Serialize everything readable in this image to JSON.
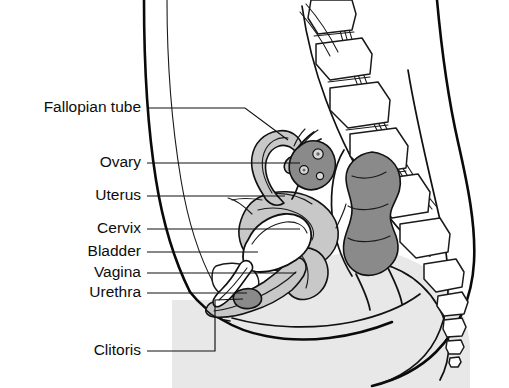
{
  "figure": {
    "width": 509,
    "height": 388,
    "background": "#ffffff"
  },
  "colors": {
    "background": "#ffffff",
    "outline": "#0a0a0a",
    "leader_line": "#111111",
    "label_text": "#0d0d0d",
    "body_fill": "#e8e8e8",
    "organ_light_gray": "#c8c8c8",
    "organ_mid_gray": "#b4b4b4",
    "organ_dark_gray": "#8a8a8a",
    "bone_fill": "#ffffff",
    "white": "#ffffff"
  },
  "labels": [
    {
      "id": "fallopian-tube",
      "text": "Fallopian tube",
      "text_x": 141,
      "text_y": 108,
      "leader": "M147,108 L245,108 L288,140",
      "structure_fill": "#c8c8c8"
    },
    {
      "id": "ovary",
      "text": "Ovary",
      "text_x": 141,
      "text_y": 163,
      "leader": "M147,163 L300,163",
      "structure_fill": "#8a8a8a"
    },
    {
      "id": "uterus",
      "text": "Uterus",
      "text_x": 141,
      "text_y": 196,
      "leader": "M147,196 L285,196",
      "structure_fill": "#c8c8c8"
    },
    {
      "id": "cervix",
      "text": "Cervix",
      "text_x": 141,
      "text_y": 229,
      "leader": "M147,229 L300,229",
      "structure_fill": "#c8c8c8"
    },
    {
      "id": "bladder",
      "text": "Bladder",
      "text_x": 141,
      "text_y": 252,
      "leader": "M147,252 L258,252",
      "structure_fill": "#ffffff"
    },
    {
      "id": "vagina",
      "text": "Vagina",
      "text_x": 141,
      "text_y": 273,
      "leader": "M147,273 L296,273",
      "structure_fill": "#c8c8c8"
    },
    {
      "id": "urethra",
      "text": "Urethra",
      "text_x": 141,
      "text_y": 293,
      "leader": "M147,293 L247,293",
      "structure_fill": "#ffffff"
    },
    {
      "id": "clitoris",
      "text": "Clitoris",
      "text_x": 141,
      "text_y": 351,
      "leader": "M147,351 L215,351 L215,300 L243,299",
      "structure_fill": "#8a8a8a"
    }
  ],
  "unlabeled_structures": [
    {
      "id": "rectum",
      "fill": "#8a8a8a"
    },
    {
      "id": "vertebrae",
      "fill": "#ffffff"
    },
    {
      "id": "sacrum",
      "fill": "#ffffff"
    },
    {
      "id": "coccyx",
      "fill": "#ffffff"
    },
    {
      "id": "pubic-bone",
      "fill": "#ffffff"
    },
    {
      "id": "body-outline",
      "fill": "#e8e8e8"
    },
    {
      "id": "buttock",
      "fill": "#e8e8e8"
    },
    {
      "id": "abdominal-wall",
      "fill": "#ffffff"
    }
  ]
}
